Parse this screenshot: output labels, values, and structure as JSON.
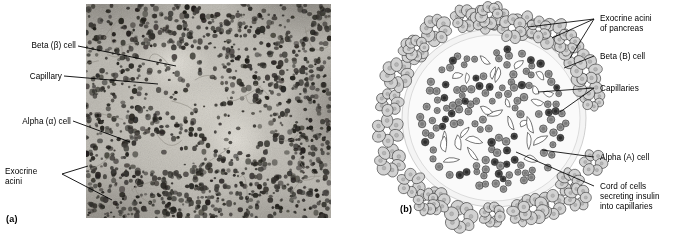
{
  "figure": {
    "panel_a": {
      "letter": "(a)",
      "type": "light-micrograph",
      "caption_labels": [
        {
          "id": "beta-cell",
          "text": "Beta (β) cell"
        },
        {
          "id": "capillary",
          "text": "Capillary"
        },
        {
          "id": "alpha-cell",
          "text": "Alpha (α) cell"
        },
        {
          "id": "exocrine-acini-1",
          "text": "Exocrine"
        },
        {
          "id": "exocrine-acini-2",
          "text": "acini"
        }
      ]
    },
    "panel_b": {
      "letter": "(b)",
      "type": "line-diagram-pancreatic-islet",
      "caption_labels": [
        {
          "id": "exocrine-acini-pancreas-1",
          "text": "Exocrine acini"
        },
        {
          "id": "exocrine-acini-pancreas-2",
          "text": "of pancreas"
        },
        {
          "id": "beta-b-cell",
          "text": "Beta (B) cell"
        },
        {
          "id": "capillaries",
          "text": "Capillaries"
        },
        {
          "id": "alpha-a-cell",
          "text": "Alpha (A) cell"
        },
        {
          "id": "cord-of-cells-1",
          "text": "Cord of cells"
        },
        {
          "id": "cord-of-cells-2",
          "text": "secreting insulin"
        },
        {
          "id": "cord-of-cells-3",
          "text": "into capillaries"
        }
      ]
    }
  },
  "colors": {
    "text": "#000000",
    "leader_line": "#000000",
    "page_background": "#ffffff",
    "acinar_cell_fill": "#d2d2d2",
    "islet_cell_fill": "#9a9a9a",
    "alpha_cell_fill": "#4f4f4f",
    "capillary_fill": "#ffffff",
    "outline": "#1a1a1a",
    "micrograph_base": "#b9b6ae",
    "micrograph_nuclei": "#3a3732"
  }
}
